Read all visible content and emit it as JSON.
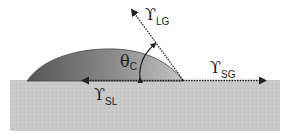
{
  "diagram": {
    "labels": {
      "lg": {
        "symbol": "ϒ",
        "subscript": "LG"
      },
      "sg": {
        "symbol": "ϒ",
        "subscript": "SG"
      },
      "sl": {
        "symbol": "ϒ",
        "subscript": "SL"
      },
      "theta": {
        "symbol": "θ",
        "subscript": "C"
      }
    },
    "colors": {
      "substrate": "#c8c8c8",
      "droplet_dark": "#5e5e5e",
      "droplet_light": "#b8b8b8",
      "arrow": "#222222"
    }
  }
}
